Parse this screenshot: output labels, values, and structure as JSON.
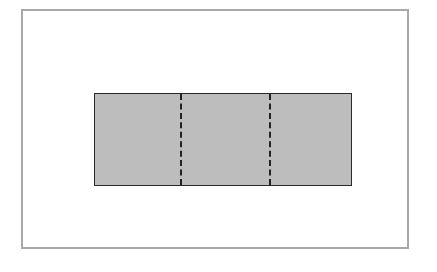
{
  "diagram": {
    "type": "rectangle divided into three equal sections by two dashed fold lines",
    "outer_frame": {
      "color": "#a8a8a8"
    },
    "rectangle": {
      "fill": "#bdbdbd",
      "stroke": "#2a2a2a",
      "sections": 3
    },
    "dashed_lines": [
      {
        "position_fraction": 0.333
      },
      {
        "position_fraction": 0.667
      }
    ]
  }
}
